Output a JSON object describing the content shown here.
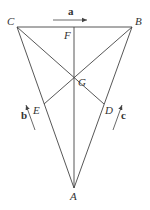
{
  "diagram": {
    "title": "",
    "points": {
      "A": {
        "label": "A",
        "x": 74,
        "y": 188
      },
      "B": {
        "label": "B",
        "x": 132,
        "y": 27
      },
      "C": {
        "label": "C",
        "x": 17,
        "y": 27
      },
      "D": {
        "label": "D",
        "x": 104,
        "y": 104
      },
      "E": {
        "label": "E",
        "x": 44,
        "y": 104
      },
      "F": {
        "label": "F",
        "x": 74,
        "y": 27
      },
      "G": {
        "label": "G",
        "x": 74,
        "y": 80
      }
    },
    "segments": [
      "CB",
      "CA",
      "BA",
      "AF",
      "CD",
      "BE"
    ],
    "vectors": {
      "a": {
        "label": "a",
        "direction": "right",
        "parallel_to": "CB"
      },
      "b": {
        "label": "b",
        "direction": "up-left",
        "parallel_to": "AC"
      },
      "c": {
        "label": "c",
        "direction": "up-right",
        "parallel_to": "AB"
      }
    },
    "colors": {
      "stroke": "#444444",
      "text": "#333333",
      "background": "#ffffff"
    }
  }
}
